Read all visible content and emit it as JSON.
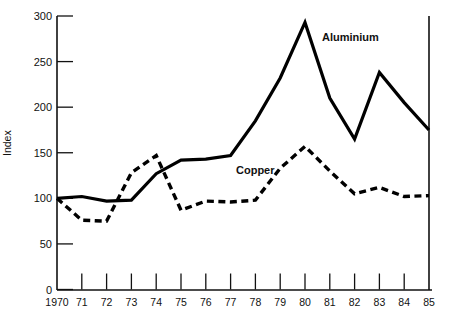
{
  "chart_data": {
    "type": "line",
    "title": "",
    "xlabel": "",
    "ylabel": "Index",
    "xlim": [
      1970,
      1985
    ],
    "ylim": [
      0,
      300
    ],
    "grid": false,
    "legend_position": "inline-annotation",
    "x": [
      1970,
      1971,
      1972,
      1973,
      1974,
      1975,
      1976,
      1977,
      1978,
      1979,
      1980,
      1981,
      1982,
      1983,
      1984,
      1985
    ],
    "xtick_labels": [
      "1970",
      "71",
      "72",
      "73",
      "74",
      "75",
      "76",
      "77",
      "78",
      "79",
      "80",
      "81",
      "82",
      "83",
      "84",
      "85"
    ],
    "ytick_labels": [
      "0",
      "50",
      "100",
      "150",
      "200",
      "250",
      "300"
    ],
    "ytick_values": [
      0,
      50,
      100,
      150,
      200,
      250,
      300
    ],
    "series": [
      {
        "name": "Aluminium",
        "style": "solid",
        "color": "#000000",
        "label_text": "Aluminium",
        "values": [
          100,
          102,
          97,
          98,
          127,
          142,
          143,
          147,
          185,
          232,
          293,
          210,
          165,
          238,
          205,
          175
        ]
      },
      {
        "name": "Copper",
        "style": "dashed",
        "color": "#000000",
        "label_text": "Copper",
        "values": [
          100,
          76,
          75,
          128,
          147,
          87,
          97,
          96,
          98,
          133,
          157,
          130,
          105,
          112,
          102,
          103
        ]
      }
    ]
  },
  "annotations": {
    "aluminium_label": "Aluminium",
    "copper_label": "Copper",
    "y_axis_title": "Index"
  }
}
